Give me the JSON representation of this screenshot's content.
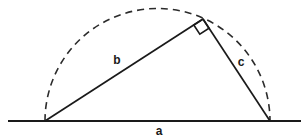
{
  "diagram": {
    "background_color": "#ffffff",
    "stroke_color": "#1a1a1a",
    "dashed_stroke_color": "#2b2b2b",
    "labels": {
      "hypotenuse": "a",
      "leg_long": "b",
      "leg_short": "c"
    },
    "label_positions": {
      "hypotenuse": {
        "x": 159,
        "y": 135
      },
      "leg_long": {
        "x": 117,
        "y": 64
      },
      "leg_short": {
        "x": 241,
        "y": 66
      }
    },
    "points": {
      "left_vertex": {
        "x": 45,
        "y": 121
      },
      "right_vertex": {
        "x": 270,
        "y": 121
      },
      "apex": {
        "x": 203,
        "y": 19
      }
    },
    "baseline": {
      "x1": 8,
      "y1": 121,
      "x2": 301,
      "y2": 121
    },
    "semicircle": {
      "center_x": 157.5,
      "center_y": 121,
      "radius": 112.5,
      "dash_pattern": "7 5"
    },
    "right_angle_marker": {
      "size": 11,
      "vertex_x": 203,
      "vertex_y": 19
    }
  }
}
